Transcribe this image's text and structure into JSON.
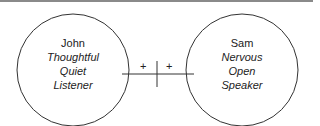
{
  "diagram": {
    "border_color": "#8a8a8a",
    "line_color": "#333333",
    "nodes": [
      {
        "name": "John",
        "traits": [
          "Thoughtful",
          "Quiet",
          "Listener"
        ]
      },
      {
        "name": "Sam",
        "traits": [
          "Nervous",
          "Open",
          "Speaker"
        ]
      }
    ],
    "connector": {
      "left_sign": "+",
      "right_sign": "+"
    }
  }
}
